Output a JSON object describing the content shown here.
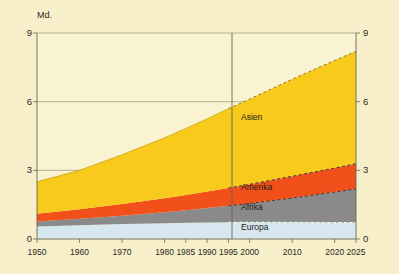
{
  "chart_data": {
    "type": "area",
    "title": "",
    "subtitle": "",
    "unit_label": "Md.",
    "xlabel": "",
    "ylabel": "Md.",
    "stacked": true,
    "grid": true,
    "legend_position": "inline-labels",
    "xlim": [
      1950,
      2025
    ],
    "ylim": [
      0,
      9
    ],
    "yticks": [
      0,
      3,
      6,
      9
    ],
    "ytick_labels_left": [
      "0",
      "3",
      "6",
      "9"
    ],
    "ytick_labels_right": [
      "0",
      "3",
      "6",
      "9"
    ],
    "xticks": [
      1950,
      1960,
      1970,
      1980,
      1985,
      1990,
      1995,
      2000,
      2010,
      2020,
      2025
    ],
    "xtick_labels": [
      "1950",
      "1960",
      "1970",
      "1980",
      "1985",
      "1990",
      "1995",
      "2000",
      "2010",
      "2020",
      "2025"
    ],
    "projection_start": 1995,
    "projection_note": "Werte ab 1995 gestrichelt (Prognose)",
    "x": [
      1950,
      1960,
      1970,
      1980,
      1985,
      1990,
      1995,
      2000,
      2010,
      2020,
      2025
    ],
    "series": [
      {
        "name": "Europa",
        "color": "#d7e7f0",
        "values": [
          0.55,
          0.6,
          0.66,
          0.69,
          0.71,
          0.72,
          0.73,
          0.73,
          0.73,
          0.72,
          0.72
        ]
      },
      {
        "name": "Afrika",
        "color": "#8a8a8a",
        "values": [
          0.22,
          0.28,
          0.36,
          0.48,
          0.55,
          0.63,
          0.72,
          0.82,
          1.06,
          1.33,
          1.47
        ]
      },
      {
        "name": "Amerika",
        "color": "#f2501a",
        "values": [
          0.33,
          0.42,
          0.51,
          0.61,
          0.66,
          0.72,
          0.78,
          0.84,
          0.95,
          1.05,
          1.1
        ]
      },
      {
        "name": "Asien",
        "color": "#f7ca1c",
        "values": [
          1.4,
          1.7,
          2.15,
          2.64,
          2.91,
          3.18,
          3.46,
          3.72,
          4.24,
          4.7,
          4.91
        ]
      }
    ],
    "totals": [
      2.5,
      3.0,
      3.68,
      4.42,
      4.83,
      5.25,
      5.69,
      6.11,
      6.98,
      7.8,
      8.2
    ],
    "series_labels": [
      {
        "name": "Asien",
        "x_px": 241,
        "y_px": 118
      },
      {
        "name": "Amerika",
        "x_px": 241,
        "y_px": 188
      },
      {
        "name": "Afrika",
        "x_px": 241,
        "y_px": 208
      },
      {
        "name": "Europa",
        "x_px": 241,
        "y_px": 228
      }
    ]
  },
  "colors": {
    "background": "#f7efc9",
    "plot_background": "#faf3d2",
    "axis": "#6b6450",
    "grid": "#9a9276",
    "text": "#2b2a26",
    "asien": "#f7ca1c",
    "amerika": "#f2501a",
    "afrika": "#8a8a8a",
    "europa": "#d7e7f0"
  }
}
